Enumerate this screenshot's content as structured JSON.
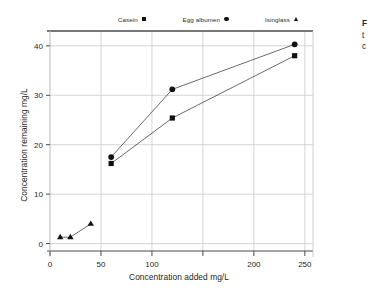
{
  "chart_data": {
    "type": "line",
    "title": "",
    "xlabel": "Concentration added mg/L",
    "ylabel": "Concentration remaining mg/L",
    "xlim": [
      0,
      258
    ],
    "ylim": [
      -1.5,
      43
    ],
    "xticks": [
      0,
      50,
      100,
      150,
      200,
      250
    ],
    "xticklabels": [
      "0",
      "50",
      "100",
      "",
      "200",
      "250"
    ],
    "yticks": [
      0,
      10,
      20,
      30,
      40
    ],
    "yticklabels": [
      "0",
      "10",
      "20",
      "30",
      "40"
    ],
    "grid": "horizontal-and-vertical-light",
    "legend_position": "top-center",
    "series": [
      {
        "name": "Casein",
        "marker": "square",
        "points": [
          {
            "x": 60,
            "y": 16.2
          },
          {
            "x": 120,
            "y": 25.4
          },
          {
            "x": 240,
            "y": 38.0
          }
        ]
      },
      {
        "name": "Egg albumen",
        "marker": "circle",
        "points": [
          {
            "x": 60,
            "y": 17.5
          },
          {
            "x": 120,
            "y": 31.2
          },
          {
            "x": 240,
            "y": 40.3
          }
        ]
      },
      {
        "name": "Isinglass",
        "marker": "triangle",
        "points": [
          {
            "x": 10,
            "y": 1.3
          },
          {
            "x": 20,
            "y": 1.3
          },
          {
            "x": 40,
            "y": 4.0
          }
        ]
      }
    ]
  },
  "legend": {
    "entries": [
      {
        "label": "Casein",
        "marker": "square-marker"
      },
      {
        "label": "Egg albumen",
        "marker": "circle-marker"
      },
      {
        "label": "Isinglass",
        "marker": "triangle-marker"
      }
    ]
  },
  "axes": {
    "x_title": "Concentration added mg/L",
    "y_title": "Concentration remaining mg/L"
  },
  "side_text": {
    "line1": "F",
    "line2": "t",
    "line3": "c"
  },
  "colors": {
    "ink": "#231f20",
    "marker": "#111111",
    "grid": "#c9c9c9",
    "axis": "#555555",
    "background": "#ffffff"
  }
}
